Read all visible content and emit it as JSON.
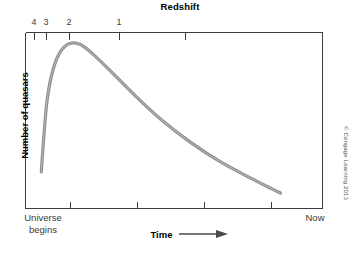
{
  "chart_data": {
    "type": "line",
    "title": "Redshift",
    "xlabel": "Time",
    "ylabel": "Number of quasars",
    "x_start_label": "Universe begins",
    "x_end_label": "Now",
    "grid": false,
    "legend": null,
    "axes": {
      "top_axis_name": "Redshift",
      "top_tick_labels": [
        "4",
        "3",
        "2",
        "1"
      ],
      "top_tick_values": [
        4,
        3,
        2,
        1,
        0.5
      ],
      "bottom_tick_count": 4,
      "xlim_label": [
        "Universe begins",
        "Now"
      ],
      "ylim_labels": []
    },
    "series": [
      {
        "name": "Number of quasars",
        "color": "#8c8c8c",
        "description": "Rises steeply from early universe, peaks near redshift 2.5, then declines smoothly toward the present",
        "points": [
          {
            "x": 0.055,
            "y": 0.205
          },
          {
            "x": 0.062,
            "y": 0.375
          },
          {
            "x": 0.075,
            "y": 0.62
          },
          {
            "x": 0.095,
            "y": 0.79
          },
          {
            "x": 0.12,
            "y": 0.89
          },
          {
            "x": 0.15,
            "y": 0.935
          },
          {
            "x": 0.185,
            "y": 0.93
          },
          {
            "x": 0.225,
            "y": 0.88
          },
          {
            "x": 0.29,
            "y": 0.775
          },
          {
            "x": 0.37,
            "y": 0.64
          },
          {
            "x": 0.46,
            "y": 0.5
          },
          {
            "x": 0.56,
            "y": 0.37
          },
          {
            "x": 0.66,
            "y": 0.26
          },
          {
            "x": 0.76,
            "y": 0.17
          },
          {
            "x": 0.83,
            "y": 0.11
          },
          {
            "x": 0.86,
            "y": 0.085
          }
        ]
      }
    ]
  },
  "chart": {
    "title": "Redshift",
    "y_axis_label": "Number of quasars",
    "x_axis_label": "Time",
    "x_start_label": "Universe begins",
    "x_end_label": "Now",
    "top_ticks": [
      {
        "label": "4",
        "x": 34
      },
      {
        "label": "3",
        "x": 46
      },
      {
        "label": "2",
        "x": 69
      },
      {
        "label": "1",
        "x": 119
      }
    ],
    "credit": "© Cengage Learning 2013"
  },
  "colors": {
    "curve": "#8c8c8c",
    "curve_edge": "#6e6e6e",
    "axis": "#3d3d3d",
    "text": "#1a1a1a"
  }
}
